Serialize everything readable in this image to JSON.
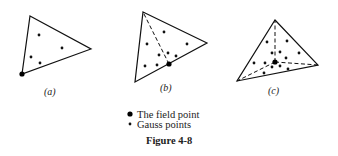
{
  "figure": {
    "caption": "Figure 4-8",
    "panels": [
      {
        "id": "a",
        "label": "(a)",
        "vertices": [
          [
            30,
            16
          ],
          [
            91,
            49
          ],
          [
            22,
            74
          ]
        ],
        "field_point": [
          22,
          74
        ],
        "dashed_from_field_to_vertices": [],
        "gauss_points": [
          [
            39,
            35
          ],
          [
            62,
            48
          ],
          [
            31,
            57
          ],
          [
            40,
            63
          ]
        ]
      },
      {
        "id": "b",
        "label": "(b)",
        "vertices": [
          [
            143,
            12
          ],
          [
            207,
            43
          ],
          [
            135,
            82
          ]
        ],
        "field_point": [
          169,
          64
        ],
        "dashed_from_field_to_vertices": [
          0
        ],
        "gauss_points": [
          [
            164,
            32
          ],
          [
            147,
            44
          ],
          [
            187,
            44
          ],
          [
            159,
            55
          ],
          [
            168,
            53
          ],
          [
            176,
            56
          ],
          [
            145,
            66
          ],
          [
            157,
            65
          ]
        ]
      },
      {
        "id": "c",
        "label": "(c)",
        "vertices": [
          [
            275,
            20
          ],
          [
            318,
            65
          ],
          [
            237,
            81
          ]
        ],
        "field_point": [
          275,
          62
        ],
        "dashed_from_field_to_vertices": [
          0,
          1,
          2
        ],
        "gauss_points": [
          [
            267,
            42
          ],
          [
            287,
            41
          ],
          [
            272,
            53
          ],
          [
            280,
            52
          ],
          [
            299,
            53
          ],
          [
            254,
            63
          ],
          [
            265,
            63
          ],
          [
            286,
            58
          ],
          [
            272,
            67
          ],
          [
            280,
            66
          ],
          [
            288,
            69
          ],
          [
            264,
            73
          ]
        ]
      }
    ],
    "legend": [
      {
        "marker": "large-dot",
        "label": "The field point"
      },
      {
        "marker": "small-dot",
        "label": "Gauss points"
      }
    ]
  }
}
